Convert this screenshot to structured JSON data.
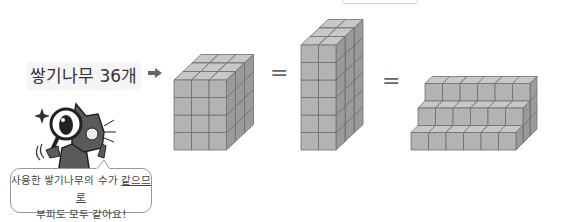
{
  "label": {
    "text": "쌓기나무 36개",
    "icon": "right-arrow-icon"
  },
  "equals": [
    "=",
    "="
  ],
  "shapes": [
    {
      "name": "cuboid-3x3x4",
      "wide": 3,
      "deep": 3,
      "high": 4,
      "count": 36
    },
    {
      "name": "cuboid-2x3x6",
      "wide": 2,
      "deep": 3,
      "high": 6,
      "count": 36
    },
    {
      "name": "stairs-6wide-3steps",
      "wide": 6,
      "steps": [
        3,
        2,
        1
      ],
      "count": 36
    }
  ],
  "bubble": {
    "line1_prefix": "사용한 쌓기나무의 수가 ",
    "line1_underlined": "같으므로",
    "line2": "부피도 모두 같아요!"
  },
  "character": "cat-with-magnifying-glass",
  "colors": {
    "cube_front": "#b3b3b3",
    "cube_top": "#c8c8c8",
    "cube_side": "#9a9a9a",
    "edge": "#6e6e6e"
  }
}
